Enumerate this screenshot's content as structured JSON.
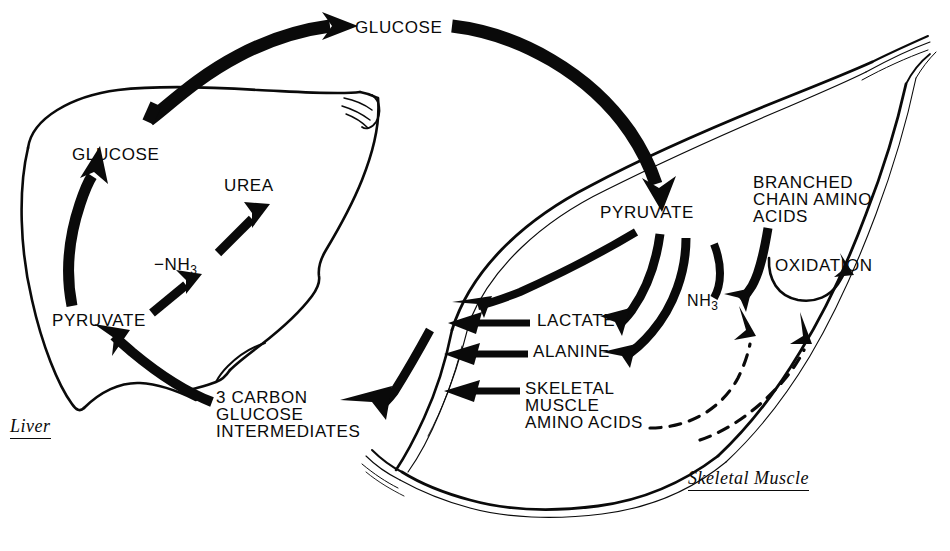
{
  "figure": {
    "type": "metabolic-cycle-diagram",
    "background_color": "#ffffff",
    "ink_color": "#0a0a0a"
  },
  "organs": [
    {
      "id": "liver",
      "label": "Liver",
      "style": "italic-underlined"
    },
    {
      "id": "skeletal_muscle",
      "label": "Skeletal Muscle",
      "style": "italic-underlined"
    }
  ],
  "labels": {
    "blood_glucose": "GLUCOSE",
    "liver_glucose": "GLUCOSE",
    "urea": "UREA",
    "minus_nh3_prefix": "−NH",
    "minus_nh3_sub": "3",
    "liver_pyruvate": "PYRUVATE",
    "three_carbon_line1": "3 CARBON",
    "three_carbon_line2": "GLUCOSE",
    "three_carbon_line3": "INTERMEDIATES",
    "muscle_pyruvate": "PYRUVATE",
    "lactate": "LACTATE",
    "alanine": "ALANINE",
    "skeletal_line1": "SKELETAL",
    "skeletal_line2": "MUSCLE",
    "skeletal_line3": "AMINO ACIDS",
    "nh3_prefix": "NH",
    "nh3_sub": "3",
    "branched_line1": "BRANCHED",
    "branched_line2": "CHAIN AMINO",
    "branched_line3": "ACIDS",
    "oxidation": "OXIDATION"
  },
  "flows": [
    {
      "from": "liver_glucose",
      "to": "blood_glucose",
      "weight": "thick"
    },
    {
      "from": "blood_glucose",
      "to": "muscle_pyruvate",
      "weight": "thick"
    },
    {
      "from": "liver_pyruvate",
      "to": "liver_glucose",
      "weight": "thick"
    },
    {
      "from": "liver_pyruvate",
      "to": "minus_nh3",
      "weight": "medium"
    },
    {
      "from": "minus_nh3",
      "to": "urea",
      "weight": "medium"
    },
    {
      "from": "three_carbon_intermediates",
      "to": "liver_pyruvate",
      "weight": "thick"
    },
    {
      "from": "muscle_export",
      "to": "three_carbon_intermediates",
      "weight": "thick"
    },
    {
      "from": "muscle_pyruvate",
      "to": "lactate",
      "weight": "thick"
    },
    {
      "from": "muscle_pyruvate",
      "to": "alanine",
      "weight": "thick"
    },
    {
      "from": "nh3",
      "to": "alanine",
      "weight": "thick"
    },
    {
      "from": "muscle_pyruvate",
      "to": "nh3",
      "weight": "thick"
    },
    {
      "from": "branched_chain_amino_acids",
      "to": "nh3",
      "weight": "thick"
    },
    {
      "from": "branched_chain_amino_acids",
      "to": "oxidation",
      "weight": "thin-curve"
    },
    {
      "from": "skeletal_muscle_amino_acids",
      "to": "nh3",
      "weight": "dashed"
    },
    {
      "from": "skeletal_muscle_amino_acids",
      "to": "oxidation",
      "weight": "dashed"
    }
  ]
}
